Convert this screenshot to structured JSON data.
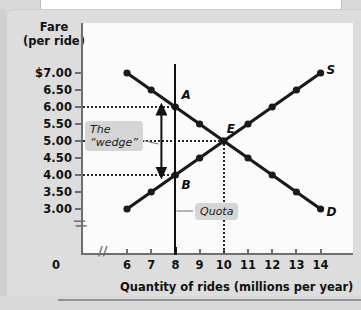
{
  "chart_data": {
    "type": "line",
    "title": "",
    "xlabel": "Quantity of rides (millions per year)",
    "ylabel_line1": "Fare",
    "ylabel_line2": "(per ride)",
    "xlim": [
      6,
      14
    ],
    "ylim": [
      3.0,
      7.0
    ],
    "grid": "horizontal dotted at 6.00, 5.00, 4.00; vertical dotted at x=10",
    "legend_position": "inline curve labels at right endpoints",
    "x_tick_labels": [
      "6",
      "7",
      "8",
      "9",
      "10",
      "11",
      "12",
      "13",
      "14"
    ],
    "y_tick_labels": [
      "$7.00",
      "6.50",
      "6.00",
      "5.50",
      "5.00",
      "4.50",
      "4.00",
      "3.50",
      "3.00"
    ],
    "origin_label": "0",
    "axis_break_x": "//",
    "axis_break_y": "//",
    "series": [
      {
        "name": "D",
        "label": "D",
        "x": [
          6,
          7,
          8,
          9,
          10,
          11,
          12,
          13,
          14
        ],
        "values": [
          7.0,
          6.5,
          6.0,
          5.5,
          5.0,
          4.5,
          4.0,
          3.5,
          3.0
        ]
      },
      {
        "name": "S",
        "label": "S",
        "x": [
          6,
          7,
          8,
          9,
          10,
          11,
          12,
          13,
          14
        ],
        "values": [
          3.0,
          3.5,
          4.0,
          4.5,
          5.0,
          5.5,
          6.0,
          6.5,
          7.0
        ]
      }
    ],
    "annotations": [
      {
        "name": "point-a",
        "label": "A",
        "x": 8,
        "y": 6.0
      },
      {
        "name": "point-b",
        "label": "B",
        "x": 8,
        "y": 4.0
      },
      {
        "name": "point-e",
        "label": "E",
        "x": 10,
        "y": 5.0
      },
      {
        "name": "wedge",
        "label_line1": "The",
        "label_line2": "“wedge”",
        "from_y": 6.0,
        "to_y": 4.0,
        "at_x": 8
      },
      {
        "name": "quota",
        "label": "Quota",
        "at_x": 8
      }
    ],
    "colors": {
      "curve": "#1a1a1a",
      "axis": "#6f6f6f",
      "plot_background": "#fbfbfb",
      "page_background": "#d9d9d9",
      "callout_background": "#d5d5d5"
    }
  },
  "axes": {
    "y_title_line1": "Fare",
    "y_title_line2": "(per ride)",
    "x_title": "Quantity of rides (millions per year)",
    "origin": "0",
    "break_mark": "//"
  },
  "y_ticks": [
    {
      "label": "$7.00",
      "value": 7.0
    },
    {
      "label": "6.50",
      "value": 6.5
    },
    {
      "label": "6.00",
      "value": 6.0
    },
    {
      "label": "5.50",
      "value": 5.5
    },
    {
      "label": "5.00",
      "value": 5.0
    },
    {
      "label": "4.50",
      "value": 4.5
    },
    {
      "label": "4.00",
      "value": 4.0
    },
    {
      "label": "3.50",
      "value": 3.5
    },
    {
      "label": "3.00",
      "value": 3.0
    }
  ],
  "x_ticks": [
    {
      "label": "6",
      "value": 6
    },
    {
      "label": "7",
      "value": 7
    },
    {
      "label": "8",
      "value": 8
    },
    {
      "label": "9",
      "value": 9
    },
    {
      "label": "10",
      "value": 10
    },
    {
      "label": "11",
      "value": 11
    },
    {
      "label": "12",
      "value": 12
    },
    {
      "label": "13",
      "value": 13
    },
    {
      "label": "14",
      "value": 14
    }
  ],
  "labels": {
    "point_a": "A",
    "point_b": "B",
    "point_e": "E",
    "supply": "S",
    "demand": "D",
    "wedge_line1": "The",
    "wedge_line2": "“wedge”",
    "quota": "Quota"
  }
}
